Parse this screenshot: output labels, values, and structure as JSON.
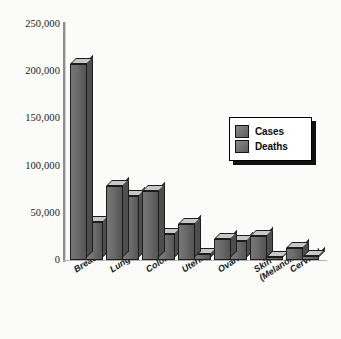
{
  "chart_data": {
    "type": "bar",
    "title": "",
    "subtitle": "",
    "xlabel": "",
    "ylabel": "",
    "ylim": [
      0,
      250000
    ],
    "grid": false,
    "legend_position": "right-inside",
    "categories": [
      "Breast",
      "Lung",
      "Colorectal",
      "Uterine",
      "Ovarian",
      "Skin (Melanoma)",
      "Cervical"
    ],
    "category_lines": [
      [
        "Breast",
        ""
      ],
      [
        "Lung",
        ""
      ],
      [
        "Colorectal",
        ""
      ],
      [
        "Uterine",
        ""
      ],
      [
        "Ovarian",
        ""
      ],
      [
        "Skin",
        "(Melanoma)"
      ],
      [
        "Cervical",
        ""
      ]
    ],
    "series": [
      {
        "name": "Cases",
        "values": [
          208000,
          78000,
          73000,
          38000,
          22000,
          25000,
          13000
        ]
      },
      {
        "name": "Deaths",
        "values": [
          40000,
          68000,
          28000,
          6000,
          20000,
          3000,
          4500
        ]
      }
    ],
    "ytick_labels": [
      "250,000",
      "200,000",
      "150,000",
      "100,000",
      "50,000",
      "0"
    ],
    "ytick_values": [
      250000,
      200000,
      150000,
      100000,
      50000,
      0
    ]
  },
  "legend": {
    "items": [
      {
        "label": "Cases",
        "swatch": "cases-swatch"
      },
      {
        "label": "Deaths",
        "swatch": "deaths-swatch"
      }
    ]
  },
  "colors": {
    "bar_face": "#6e6e6e",
    "bar_top": "#c7c7c7",
    "bar_side": "#4e4e4e",
    "outline": "#1c1c1c",
    "axis": "#8e8e8e",
    "background": "#fbfbfa",
    "text": "#161616"
  }
}
